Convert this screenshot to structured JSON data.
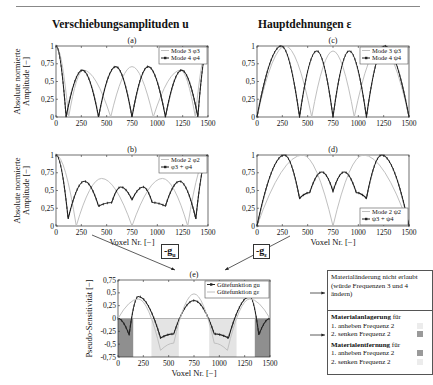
{
  "page": {
    "column_titles": {
      "left": "Verschiebungsamplituden u",
      "right": "Hauptdehnungen ε"
    },
    "shared_ylabel_top": "Absolute normierte Amplitude [−]",
    "xlabel": "Voxel Nr. [−]",
    "gradient_labels": {
      "u": "-g",
      "u_sub": "u",
      "e": "-g",
      "e_sub": "ε"
    },
    "notes": {
      "box1": "Materialänderung nicht erlaubt (würde Frequenzen 3 und 4 ändern)",
      "box2_title1": "Materialanlagerung",
      "box2_title1_suffix": " für",
      "box2_l1": "1. anheben Frequenz 2",
      "box2_l2": "2. senken Frequenz 2",
      "box2_title2": "Materialentfernung",
      "box2_title2_suffix": " für",
      "box2_l3": "1. anheben Frequenz 2",
      "box2_l4": "2. senken Frequenz 2"
    },
    "colors": {
      "dark": "#222222",
      "light": "#c0c0c0",
      "shade_dark": "#8f8f8f",
      "shade_light": "#e4e4e4"
    }
  },
  "chart_data": [
    {
      "id": "a",
      "panel_label": "(a)",
      "type": "line",
      "xlabel": "",
      "ylabel": "Absolute normierte Amplitude [−]",
      "xlim": [
        0,
        1500
      ],
      "ylim": [
        0,
        1
      ],
      "xticks": [
        0,
        250,
        500,
        750,
        1000,
        1250,
        1500
      ],
      "yticks": [
        0,
        0.25,
        0.5,
        0.75,
        1
      ],
      "legend": {
        "position": "upper right",
        "entries": [
          "Mode 3  φ3",
          "Mode 4  φ4"
        ]
      },
      "series": [
        {
          "name": "Mode 3 φ3",
          "color": "light",
          "x": [
            0,
            125,
            270,
            540,
            750,
            960,
            1230,
            1375,
            1500
          ],
          "y": [
            1,
            0,
            0.66,
            0,
            0.71,
            0,
            0.66,
            0,
            1
          ]
        },
        {
          "name": "Mode 4 φ4",
          "color": "dark",
          "markers": true,
          "x": [
            0,
            100,
            260,
            420,
            590,
            750,
            910,
            1080,
            1240,
            1400,
            1500
          ],
          "y": [
            1,
            0,
            0.66,
            0,
            0.71,
            0,
            0.71,
            0,
            0.66,
            0,
            1
          ]
        }
      ]
    },
    {
      "id": "b",
      "panel_label": "(b)",
      "type": "line",
      "xlabel": "Voxel Nr. [−]",
      "ylabel": "Absolute normierte Amplitude [−]",
      "xlim": [
        0,
        1500
      ],
      "ylim": [
        0,
        1
      ],
      "xticks": [
        0,
        250,
        500,
        750,
        1000,
        1250,
        1500
      ],
      "yticks": [
        0,
        0.25,
        0.5,
        0.75,
        1
      ],
      "legend": {
        "position": "upper right",
        "entries": [
          "Mode 2  φ2",
          "φ3 + φ4"
        ]
      },
      "series": [
        {
          "name": "Mode 2 φ2",
          "color": "light",
          "x": [
            0,
            200,
            450,
            750,
            1050,
            1300,
            1500
          ],
          "y": [
            1,
            0,
            0.67,
            0,
            0.67,
            0,
            1
          ]
        },
        {
          "name": "φ3 + φ4",
          "color": "dark",
          "markers": true,
          "x": [
            0,
            120,
            280,
            420,
            550,
            640,
            750,
            860,
            950,
            1080,
            1220,
            1380,
            1500
          ],
          "y": [
            1,
            0.1,
            0.63,
            0.28,
            0.33,
            0.55,
            0.37,
            0.55,
            0.33,
            0.28,
            0.63,
            0.1,
            1
          ]
        }
      ]
    },
    {
      "id": "c",
      "panel_label": "(c)",
      "type": "line",
      "xlabel": "",
      "ylabel": "",
      "xlim": [
        0,
        1500
      ],
      "ylim": [
        0,
        1
      ],
      "xticks": [
        0,
        250,
        500,
        750,
        1000,
        1250,
        1500
      ],
      "yticks": [
        0,
        0.25,
        0.5,
        0.75,
        1
      ],
      "legend": {
        "position": "upper right",
        "entries": [
          "Mode 3  ψ3",
          "Mode 4  ψ4"
        ]
      },
      "series": [
        {
          "name": "Mode 3 ψ3",
          "color": "light",
          "x": [
            0,
            280,
            540,
            750,
            960,
            1220,
            1500
          ],
          "y": [
            0,
            1,
            0,
            0.93,
            0,
            1,
            0
          ]
        },
        {
          "name": "Mode 4 ψ4",
          "color": "dark",
          "markers": true,
          "x": [
            0,
            240,
            420,
            590,
            750,
            910,
            1080,
            1260,
            1500
          ],
          "y": [
            0,
            1,
            0,
            0.93,
            0,
            0.93,
            0,
            1,
            0
          ]
        }
      ]
    },
    {
      "id": "d",
      "panel_label": "(d)",
      "type": "line",
      "xlabel": "Voxel Nr. [−]",
      "ylabel": "",
      "xlim": [
        0,
        1500
      ],
      "ylim": [
        0,
        1
      ],
      "xticks": [
        0,
        250,
        500,
        750,
        1000,
        1250,
        1500
      ],
      "yticks": [
        0,
        0.25,
        0.5,
        0.75,
        1
      ],
      "legend": {
        "position": "lower right",
        "entries": [
          "Mode 2  ψ2",
          "ψ3 + ψ4"
        ]
      },
      "series": [
        {
          "name": "Mode 2 ψ2",
          "color": "light",
          "x": [
            0,
            450,
            750,
            1050,
            1500
          ],
          "y": [
            0,
            1,
            0,
            1,
            0
          ]
        },
        {
          "name": "ψ3 + ψ4",
          "color": "dark",
          "markers": true,
          "x": [
            0,
            270,
            420,
            520,
            640,
            750,
            860,
            980,
            1080,
            1230,
            1500
          ],
          "y": [
            0,
            1,
            0.39,
            0.47,
            0.76,
            0.49,
            0.76,
            0.47,
            0.39,
            1,
            0
          ]
        }
      ]
    },
    {
      "id": "e",
      "panel_label": "(e)",
      "type": "line",
      "xlabel": "Voxel Nr. [−]",
      "ylabel": "Pseudo-Sensitivität [−]",
      "xlim": [
        0,
        1500
      ],
      "ylim": [
        -0.75,
        0.75
      ],
      "xticks": [
        0,
        250,
        500,
        750,
        1000,
        1250,
        1500
      ],
      "yticks": [
        -0.75,
        -0.5,
        -0.25,
        0,
        0.25,
        0.5,
        0.75
      ],
      "legend": {
        "position": "upper right",
        "entries": [
          "Gütefunktion gu",
          "Gütefunktion gε"
        ]
      },
      "shaded_regions": [
        {
          "x": [
            0,
            150
          ],
          "shade": "dark"
        },
        {
          "x": [
            330,
            600
          ],
          "shade": "light"
        },
        {
          "x": [
            900,
            1170
          ],
          "shade": "light"
        },
        {
          "x": [
            1350,
            1500
          ],
          "shade": "dark"
        }
      ],
      "series": [
        {
          "name": "Gütefunktion gu",
          "color": "dark",
          "markers": true,
          "x": [
            0,
            110,
            200,
            420,
            550,
            750,
            950,
            1090,
            1300,
            1390,
            1500
          ],
          "y": [
            0,
            -0.32,
            0.43,
            -0.38,
            -0.3,
            0.35,
            -0.3,
            -0.38,
            0.43,
            -0.32,
            0
          ]
        },
        {
          "name": "Gütefunktion gε",
          "color": "light",
          "x": [
            0,
            200,
            420,
            550,
            750,
            950,
            1080,
            1300,
            1500
          ],
          "y": [
            0,
            0.38,
            -0.62,
            -0.48,
            0.48,
            -0.48,
            -0.62,
            0.38,
            0
          ]
        }
      ]
    }
  ]
}
